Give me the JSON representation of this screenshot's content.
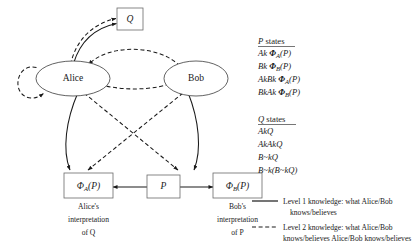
{
  "diagram": {
    "nodes": {
      "alice": "Alice",
      "bob": "Bob",
      "q_box": "Q",
      "p_box": "P",
      "phi_a": "Φ",
      "phi_a_sub": "A",
      "phi_a_arg": "(P)",
      "phi_b": "Φ",
      "phi_b_sub": "B",
      "phi_b_arg": "(P)"
    },
    "captions": {
      "alice_line1": "Alice's",
      "alice_line2": "interpretation",
      "alice_line3": "of Q",
      "bob_line1": "Bob's",
      "bob_line2": "interpretation",
      "bob_line3": "of P"
    }
  },
  "panels": {
    "p_states": {
      "heading_italic": "P",
      "heading_rest": " states",
      "items": [
        {
          "prefix": "Ak ",
          "phi": "Φ",
          "sub": "A",
          "arg": "(P)"
        },
        {
          "prefix": "Bk ",
          "phi": "Φ",
          "sub": "B",
          "arg": "(P)"
        },
        {
          "prefix": "AkBk ",
          "phi": "Φ",
          "sub": "A",
          "arg": "(P)"
        },
        {
          "prefix": "BkAk ",
          "phi": "Φ",
          "sub": "B",
          "arg": "(P)"
        }
      ]
    },
    "q_states": {
      "heading_italic": "Q",
      "heading_rest": " states",
      "items": [
        "AkQ",
        "AkAkQ",
        "B~kQ",
        "B~k(B~kQ)"
      ]
    }
  },
  "legend": {
    "entries": [
      {
        "style": "solid",
        "line1": "Level 1 knowledge: what Alice/Bob",
        "line2": "knows/believes"
      },
      {
        "style": "dashed",
        "line1": "Level 2 knowledge: what Alice/Bob",
        "line2": "knows/believes Alice/Bob knows/believes"
      }
    ]
  },
  "colors": {
    "stroke": "#1a1a1a",
    "box_stroke": "#6a6a6a",
    "ellipse_stroke": "#3a3a3a",
    "background": "#ffffff"
  }
}
